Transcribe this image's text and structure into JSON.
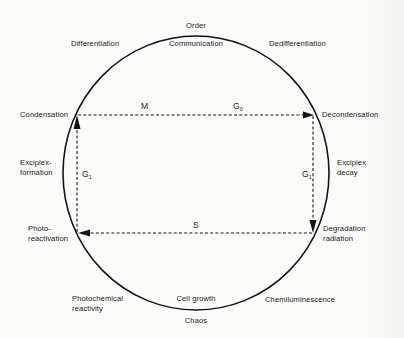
{
  "diagram": {
    "poles": {
      "top": "Order",
      "bottom": "Chaos"
    },
    "inner_arc_labels": {
      "top": "Communication",
      "bottom": "Cell growth"
    },
    "outer_labels": {
      "top_left": "Differentiation",
      "top_right": "Dedifferentiation",
      "bottom_left_line1": "Photochemical",
      "bottom_left_line2": "reactivity",
      "bottom_right": "Chemiluminescence"
    },
    "corner_labels": {
      "upper_left": "Condensation",
      "upper_right": "Decondensation",
      "lower_left_line1": "Photo-",
      "lower_left_line2": "reactivation",
      "lower_right_line1": "Degradation",
      "lower_right_line2": "radiation"
    },
    "side_labels": {
      "left_line1": "Exciplex-",
      "left_line2": "formation",
      "right_line1": "Excipiex",
      "right_line2": "decay"
    },
    "cycle_phases": {
      "top_left": "M",
      "top_right_base": "G",
      "top_right_sub": "0",
      "left_base": "G",
      "left_sub": "1",
      "right_base": "G",
      "right_sub": "1",
      "bottom": "S"
    },
    "colors": {
      "line": "#141414",
      "background": "#fbfbfa"
    }
  }
}
